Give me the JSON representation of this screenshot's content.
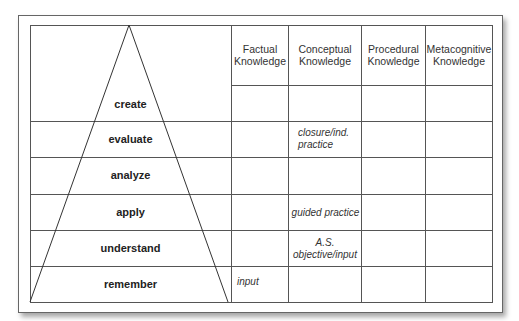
{
  "diagram": {
    "levels": [
      "create",
      "evaluate",
      "analyze",
      "apply",
      "understand",
      "remember"
    ],
    "columns": [
      "Factual Knowledge",
      "Conceptual Knowledge",
      "Procedural Knowledge",
      "Metacognitive Knowledge"
    ],
    "column_lines": [
      [
        "Factual",
        "Knowledge"
      ],
      [
        "Conceptual",
        "Knowledge"
      ],
      [
        "Procedural",
        "Knowledge"
      ],
      [
        "Metacognitive",
        "Knowledge"
      ]
    ],
    "cells": {
      "evaluate_conceptual": [
        "closure/ind.",
        "practice"
      ],
      "apply_conceptual": "guided practice",
      "understand_conceptual": [
        "A.S.",
        "objective/input"
      ],
      "remember_factual": "input"
    }
  }
}
